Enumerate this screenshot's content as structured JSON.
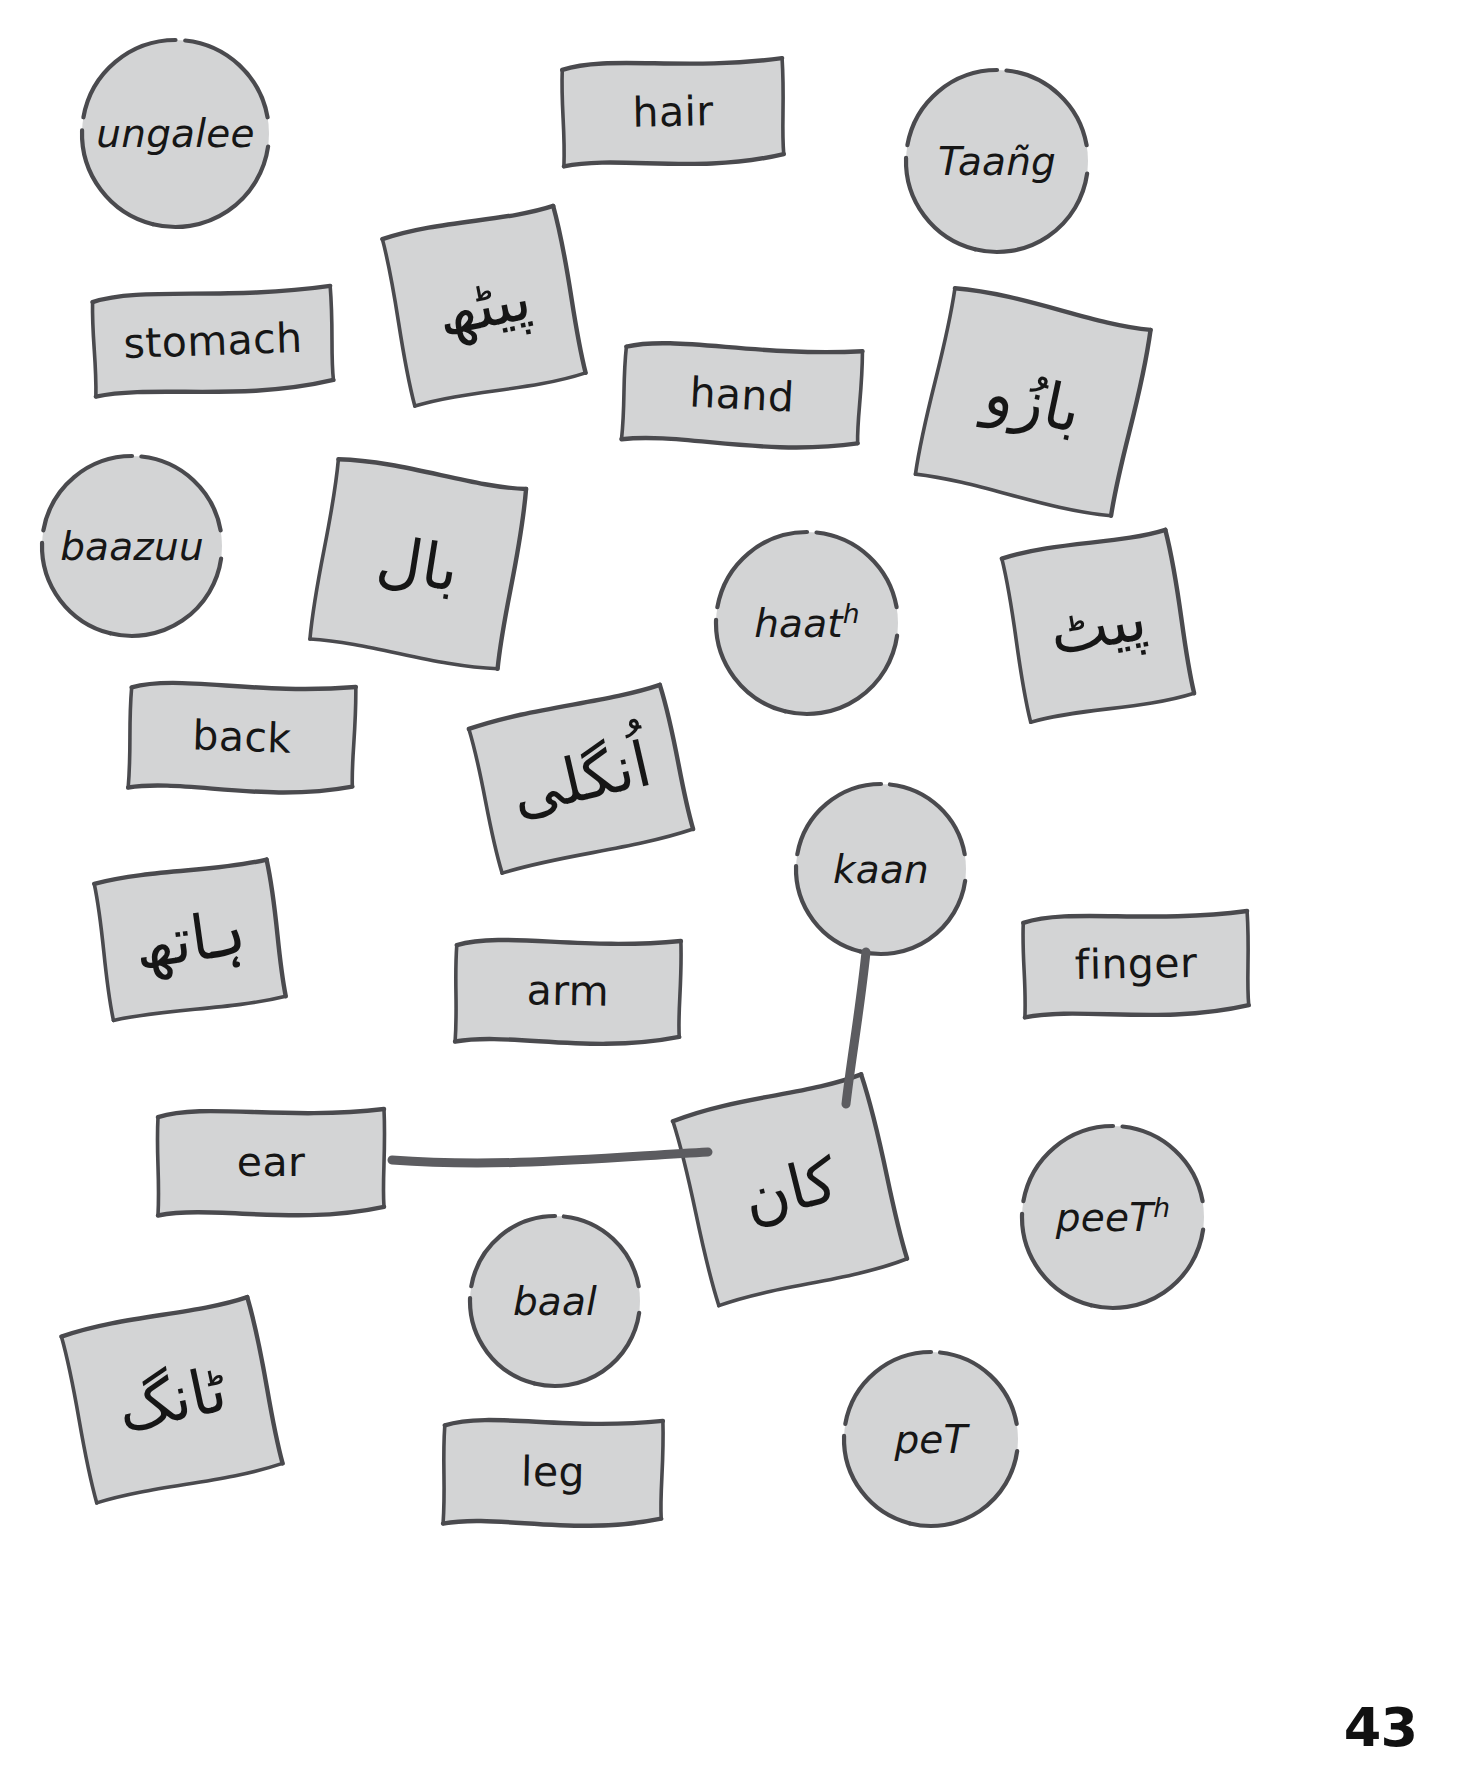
{
  "page": {
    "number": "43",
    "card_fill": "#d3d4d5",
    "card_stroke": "#4a4a4e",
    "link_color": "#5c5c60",
    "background": "#ffffff"
  },
  "cards": [
    {
      "id": "ungalee",
      "kind": "circle",
      "label": "ungalee",
      "sup": "",
      "x": 78,
      "y": 36,
      "w": 195,
      "h": 195,
      "rot": 0
    },
    {
      "id": "hair",
      "kind": "banner",
      "label": "hair",
      "sup": "",
      "x": 557,
      "y": 53,
      "w": 232,
      "h": 118,
      "rot": -1
    },
    {
      "id": "taang",
      "kind": "circle",
      "label": "Taañg",
      "sup": "",
      "x": 902,
      "y": 66,
      "w": 190,
      "h": 190,
      "rot": 0
    },
    {
      "id": "stomach",
      "kind": "banner",
      "label": "stomach",
      "sup": "",
      "x": 88,
      "y": 283,
      "w": 250,
      "h": 116,
      "rot": -2
    },
    {
      "id": "urdu-peeth",
      "kind": "square",
      "label": "پیٹھ",
      "sup": "",
      "x": 392,
      "y": 216,
      "w": 184,
      "h": 180,
      "rot": -11
    },
    {
      "id": "hand",
      "kind": "banner",
      "label": "hand",
      "sup": "",
      "x": 618,
      "y": 338,
      "w": 248,
      "h": 114,
      "rot": 3
    },
    {
      "id": "urdu-baazuu",
      "kind": "square",
      "label": "بازُو",
      "sup": "",
      "x": 928,
      "y": 302,
      "w": 210,
      "h": 200,
      "rot": 12
    },
    {
      "id": "baazuu",
      "kind": "circle",
      "label": "baazuu",
      "sup": "",
      "x": 38,
      "y": 452,
      "w": 188,
      "h": 188,
      "rot": 0
    },
    {
      "id": "urdu-baal",
      "kind": "square",
      "label": "بال",
      "sup": "",
      "x": 318,
      "y": 468,
      "w": 200,
      "h": 192,
      "rot": 9
    },
    {
      "id": "haath",
      "kind": "circle",
      "label": "haat",
      "sup": "h",
      "x": 712,
      "y": 528,
      "w": 190,
      "h": 190,
      "rot": 0
    },
    {
      "id": "urdu-peeth-2",
      "kind": "square",
      "label": "پیٹ",
      "sup": "",
      "x": 1010,
      "y": 538,
      "w": 176,
      "h": 176,
      "rot": -10
    },
    {
      "id": "back",
      "kind": "banner",
      "label": "back",
      "sup": "",
      "x": 124,
      "y": 676,
      "w": 236,
      "h": 122,
      "rot": 2
    },
    {
      "id": "urdu-ungalee",
      "kind": "square",
      "label": "اُنگلی",
      "sup": "",
      "x": 478,
      "y": 700,
      "w": 206,
      "h": 158,
      "rot": -13
    },
    {
      "id": "kaan",
      "kind": "circle",
      "label": "kaan",
      "sup": "",
      "x": 792,
      "y": 780,
      "w": 178,
      "h": 178,
      "rot": 0
    },
    {
      "id": "urdu-haath",
      "kind": "square",
      "label": "ہاتھ",
      "sup": "",
      "x": 98,
      "y": 866,
      "w": 184,
      "h": 148,
      "rot": -8
    },
    {
      "id": "arm",
      "kind": "banner",
      "label": "arm",
      "sup": "",
      "x": 450,
      "y": 932,
      "w": 236,
      "h": 118,
      "rot": 1
    },
    {
      "id": "finger",
      "kind": "banner",
      "label": "finger",
      "sup": "",
      "x": 1018,
      "y": 906,
      "w": 236,
      "h": 116,
      "rot": -1
    },
    {
      "id": "ear",
      "kind": "banner",
      "label": "ear",
      "sup": "",
      "x": 152,
      "y": 1102,
      "w": 238,
      "h": 120,
      "rot": 0
    },
    {
      "id": "urdu-kaan",
      "kind": "square",
      "label": "کان",
      "sup": "",
      "x": 688,
      "y": 1090,
      "w": 204,
      "h": 200,
      "rot": -14
    },
    {
      "id": "peeth",
      "kind": "circle",
      "label": "peeT",
      "sup": "h",
      "x": 1018,
      "y": 1122,
      "w": 190,
      "h": 190,
      "rot": 0
    },
    {
      "id": "baal",
      "kind": "circle",
      "label": "baal",
      "sup": "",
      "x": 466,
      "y": 1212,
      "w": 178,
      "h": 178,
      "rot": 0
    },
    {
      "id": "urdu-taang",
      "kind": "square",
      "label": "ٹانگ",
      "sup": "",
      "x": 72,
      "y": 1310,
      "w": 200,
      "h": 180,
      "rot": -12
    },
    {
      "id": "pet",
      "kind": "circle",
      "label": "peT",
      "sup": "",
      "x": 840,
      "y": 1348,
      "w": 182,
      "h": 182,
      "rot": 0
    },
    {
      "id": "leg",
      "kind": "banner",
      "label": "leg",
      "sup": "",
      "x": 438,
      "y": 1412,
      "w": 230,
      "h": 120,
      "rot": 1
    }
  ],
  "links": [
    {
      "id": "link-kaan-urdu",
      "from": "kaan",
      "to": "urdu-kaan",
      "path": "M 866 952 C 860 1010, 851 1060, 846 1104"
    },
    {
      "id": "link-ear-urdu",
      "from": "ear",
      "to": "urdu-kaan",
      "path": "M 392 1160 C 500 1168, 600 1158, 708 1152"
    }
  ]
}
